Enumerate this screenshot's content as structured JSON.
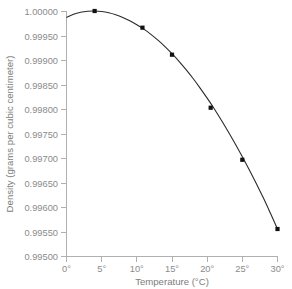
{
  "chart_data": {
    "type": "line",
    "title": "",
    "xlabel": "Temperature (°C)",
    "ylabel": "Density (grams per cubic centimeter)",
    "xlim": [
      0,
      30
    ],
    "ylim": [
      0.995,
      1.0
    ],
    "grid": false,
    "legend": null,
    "x_tick_labels": [
      "0°",
      "5°",
      "10°",
      "15°",
      "20°",
      "25°",
      "30°"
    ],
    "x_ticks": [
      0,
      5,
      10,
      15,
      20,
      25,
      30
    ],
    "y_tick_labels": [
      "1.00000",
      "0.99950",
      "0.99900",
      "0.99850",
      "0.99800",
      "0.99750",
      "0.99700",
      "0.99650",
      "0.99600",
      "0.99550",
      "0.99500"
    ],
    "y_ticks": [
      1.0,
      0.9995,
      0.999,
      0.9985,
      0.998,
      0.9975,
      0.997,
      0.9965,
      0.996,
      0.9955,
      0.995
    ],
    "series": [
      {
        "name": "Density of water",
        "marker": "square",
        "marker_color": "#111111",
        "line_color": "#2b2b2b",
        "x": [
          0,
          4,
          10.8,
          15,
          20.5,
          25,
          30
        ],
        "values": [
          0.99987,
          1.0,
          0.99966,
          0.99911,
          0.99803,
          0.99697,
          0.99556
        ],
        "marker_x": [
          4,
          10.8,
          15,
          20.5,
          25,
          30
        ],
        "marker_values": [
          1.0,
          0.99966,
          0.99911,
          0.99803,
          0.99697,
          0.99556
        ]
      }
    ],
    "curve_samples": {
      "x": [
        0,
        1,
        2,
        3,
        4,
        5,
        6,
        7,
        8,
        9,
        10,
        11,
        12,
        13,
        14,
        15,
        16,
        17,
        18,
        19,
        20,
        21,
        22,
        23,
        24,
        25,
        26,
        27,
        28,
        29,
        30
      ],
      "y": [
        0.99987,
        0.999935,
        0.999975,
        0.999995,
        1.0,
        0.99999,
        0.999965,
        0.999925,
        0.99987,
        0.9998,
        0.99972,
        0.99963,
        0.999525,
        0.999405,
        0.999275,
        0.99913,
        0.998975,
        0.998805,
        0.998625,
        0.99843,
        0.998225,
        0.99801,
        0.99778,
        0.99754,
        0.99729,
        0.99703,
        0.99676,
        0.99648,
        0.99619,
        0.99588,
        0.99556
      ]
    }
  },
  "colors": {
    "background": "#ffffff",
    "axis": "#b0b0b0",
    "tick_text": "#8b8b8b",
    "title_text": "#7d7d7d",
    "curve": "#2b2b2b",
    "marker": "#111111"
  }
}
